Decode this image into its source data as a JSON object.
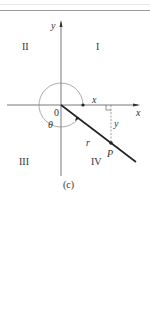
{
  "figure": {
    "caption": "(c)",
    "axis_labels": {
      "x": "x",
      "y": "y"
    },
    "quadrants": {
      "I": "I",
      "II": "II",
      "III": "III",
      "IV": "IV"
    },
    "origin_label": "0",
    "angle_label": "θ",
    "segment_labels": {
      "horizontal": "x",
      "vertical": "y",
      "radius": "r"
    },
    "point_label": "P",
    "colors": {
      "line": "#222222",
      "arc": "#888888",
      "axis": "#555555",
      "dashed": "#777777"
    }
  }
}
